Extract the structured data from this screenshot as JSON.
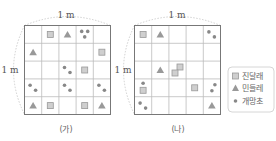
{
  "panels": [
    {
      "id": "ga",
      "caption": "(가)",
      "top_label": "1 m",
      "side_label": "1 m",
      "grid": [
        [
          [],
          [
            "square"
          ],
          [
            "triangle"
          ],
          [
            "dot3"
          ],
          []
        ],
        [
          [
            "triangle"
          ],
          [],
          [],
          [],
          [
            "square"
          ]
        ],
        [
          [],
          [],
          [
            "dot2"
          ],
          [
            "square"
          ],
          []
        ],
        [
          [
            "dot2"
          ],
          [],
          [
            "dot2"
          ],
          [],
          [
            "dot2"
          ]
        ],
        [
          [
            "triangle"
          ],
          [
            "square"
          ],
          [],
          [
            "square"
          ],
          [
            "triangle"
          ]
        ]
      ]
    },
    {
      "id": "na",
      "caption": "(나)",
      "top_label": "1 m",
      "side_label": "1 m",
      "grid": [
        [
          [
            "square"
          ],
          [
            "triangle"
          ],
          [],
          [],
          [
            "dot2"
          ]
        ],
        [
          [],
          [],
          [],
          [],
          []
        ],
        [
          [],
          [
            "triangle"
          ],
          [
            "square2"
          ],
          [],
          []
        ],
        [
          [
            "dot_square"
          ],
          [],
          [],
          [
            "square"
          ],
          [
            "dot2v"
          ]
        ],
        [
          [
            "dot2"
          ],
          [],
          [],
          [],
          [
            "triangle"
          ]
        ]
      ]
    }
  ],
  "legend": {
    "items": [
      {
        "symbol": "square",
        "label": "진달래"
      },
      {
        "symbol": "triangle",
        "label": "민들레"
      },
      {
        "symbol": "dot",
        "label": "개망초"
      }
    ]
  },
  "colors": {
    "grid_line": "#bbbbbb",
    "grid_border": "#777777",
    "square_fill": "#cfcfcf",
    "square_stroke": "#999999",
    "triangle_fill": "#999999",
    "dot_fill": "#888888",
    "dashed": "#bbbbbb"
  }
}
